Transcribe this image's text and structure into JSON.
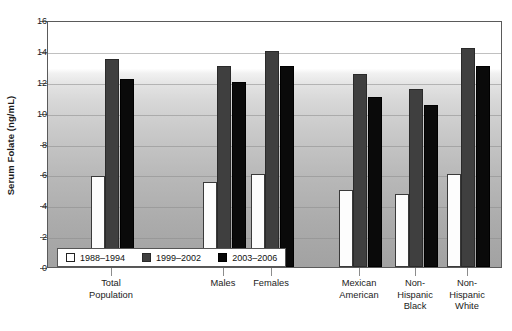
{
  "chart_data": {
    "type": "bar",
    "title": "",
    "xlabel": "",
    "ylabel": "Serum Folate (ng/mL)",
    "ylim": [
      0,
      16
    ],
    "yticks": [
      0,
      2,
      4,
      6,
      8,
      10,
      12,
      14,
      16
    ],
    "ytick_labels": [
      "0",
      "2",
      "4",
      "6",
      "8",
      "10",
      "12",
      "14",
      "16"
    ],
    "grid": true,
    "legend_position": "bottom-left-inside",
    "categories": [
      "Total\nPopulation",
      "Males",
      "Females",
      "Mexican\nAmerican",
      "Non-\nHispanic\nBlack",
      "Non-\nHispanic\nWhite"
    ],
    "series": [
      {
        "name": "1988–1994",
        "color": "#ffffff",
        "values": [
          5.9,
          5.5,
          6.0,
          5.0,
          4.75,
          6.0
        ]
      },
      {
        "name": "1999–2002",
        "color": "#3f3f3f",
        "values": [
          13.5,
          13.0,
          14.0,
          12.5,
          11.5,
          14.2
        ]
      },
      {
        "name": "2003–2006",
        "color": "#0a0a0a",
        "values": [
          12.2,
          12.0,
          13.0,
          11.0,
          10.5,
          13.0
        ]
      }
    ]
  },
  "axis": {
    "y_title": "Serum Folate (ng/mL)"
  }
}
